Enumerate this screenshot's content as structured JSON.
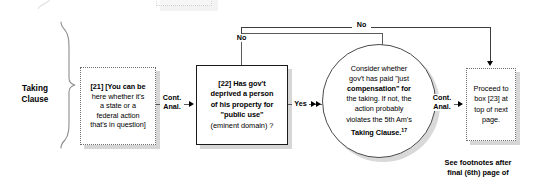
{
  "section": {
    "label_line1": "Taking",
    "label_line2": "Clause"
  },
  "nodes": {
    "box21": {
      "id": "[21]",
      "text": "[You can be here whether it's a state or a federal action that's in question]",
      "lines": [
        "[21]  [You can be",
        "here whether it's",
        "a state or a",
        "federal action",
        "that's in question]"
      ]
    },
    "box22": {
      "id": "[22]",
      "lines": [
        "[22]  Has gov't",
        "deprived a person",
        "of his property for",
        "\"public use\"",
        "(eminent domain) ?"
      ],
      "plain_text": "[22] Has gov't deprived a person of his property for \"public use\" (eminent domain) ?"
    },
    "oval": {
      "lines": [
        "Consider whether",
        "gov't has paid \"just",
        "compensation\" for",
        "the taking. If not, the",
        "action probably",
        "violates the 5th Am's",
        "Taking Clause."
      ],
      "footnote_marker": "17",
      "plain_text": "Consider whether gov't has paid \"just compensation\" for the taking. If not, the action probably violates the 5th Am's Taking Clause. 17"
    },
    "box23": {
      "lines": [
        "Proceed to",
        "box [23] at",
        "top of next",
        "page."
      ],
      "plain_text": "Proceed to box [23] at top of next page."
    }
  },
  "edges": {
    "cont_anal_left": {
      "line1": "Cont.",
      "line2": "Anal."
    },
    "no_inner": "No",
    "no_outer": "No",
    "yes": "Yes",
    "cont_anal_right": {
      "line1": "Cont.",
      "line2": "Anal."
    }
  },
  "footnote": {
    "line1": "See footnotes after",
    "line2": "final (6th) page of"
  },
  "colors": {
    "text": "#000000",
    "line": "#5a5a5a",
    "node_border_dotted": "#6e6e6e",
    "node_border_solid": "#1a1a1a",
    "shadow": "#d6d6d6",
    "background": "#ffffff"
  }
}
